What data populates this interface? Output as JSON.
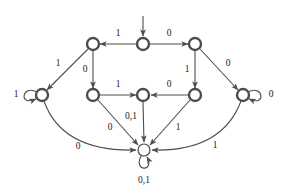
{
  "diagram": {
    "type": "state-transition-diagram",
    "stroke_color": "#4d4d4d",
    "node_fill": "#ffffff",
    "label_color": "#1a1a1a",
    "alphabet": [
      "0",
      "1"
    ]
  },
  "nodes": [
    {
      "id": "q_start",
      "name": "start-state",
      "cx": 143,
      "cy": 44,
      "r": 6.0,
      "style": "bold",
      "initial": true
    },
    {
      "id": "q_topleft",
      "name": "top-left-state",
      "cx": 93,
      "cy": 44,
      "r": 6.0,
      "style": "bold",
      "initial": false
    },
    {
      "id": "q_topright",
      "name": "top-right-state",
      "cx": 195,
      "cy": 44,
      "r": 6.0,
      "style": "bold",
      "initial": false
    },
    {
      "id": "q_farleft",
      "name": "far-left-state",
      "cx": 42,
      "cy": 95,
      "r": 6.0,
      "style": "bold",
      "initial": false
    },
    {
      "id": "q_midleft",
      "name": "mid-left-state",
      "cx": 93,
      "cy": 95,
      "r": 6.0,
      "style": "bold",
      "initial": false
    },
    {
      "id": "q_center",
      "name": "center-state",
      "cx": 143,
      "cy": 95,
      "r": 6.0,
      "style": "bold",
      "initial": false
    },
    {
      "id": "q_midright",
      "name": "mid-right-state",
      "cx": 195,
      "cy": 95,
      "r": 6.0,
      "style": "bold",
      "initial": false
    },
    {
      "id": "q_farright",
      "name": "far-right-state",
      "cx": 243,
      "cy": 95,
      "r": 6.0,
      "style": "bold",
      "initial": false
    },
    {
      "id": "q_trap",
      "name": "trap-state",
      "cx": 144,
      "cy": 150,
      "r": 6.0,
      "style": "thin",
      "initial": false
    }
  ],
  "start_arrow": {
    "name": "start-arrow",
    "path": "M 143 16 L 143 36",
    "points_to": "q_start"
  },
  "edges": [
    {
      "id": "e1",
      "name": "edge-start-to-topleft",
      "from": "q_start",
      "to": "q_topleft",
      "label": "1",
      "path": "M 136 44 L 100 44",
      "lx": 118,
      "ly": 34
    },
    {
      "id": "e2",
      "name": "edge-start-to-topright",
      "from": "q_start",
      "to": "q_topright",
      "label": "0",
      "path": "M 150 44 L 188 44",
      "lx": 169,
      "ly": 34
    },
    {
      "id": "e3",
      "name": "edge-topleft-to-farleft",
      "from": "q_topleft",
      "to": "q_farleft",
      "label": "1",
      "path": "M 88 49 L 47 90",
      "lx": 58,
      "ly": 64
    },
    {
      "id": "e4",
      "name": "edge-topleft-to-midleft",
      "from": "q_topleft",
      "to": "q_midleft",
      "label": "0",
      "path": "M 93 51 L 93 88",
      "lx": 85,
      "ly": 70
    },
    {
      "id": "e5",
      "name": "edge-topright-to-midright",
      "from": "q_topright",
      "to": "q_midright",
      "label": "1",
      "path": "M 195 51 L 195 88",
      "lx": 187,
      "ly": 70
    },
    {
      "id": "e6",
      "name": "edge-topright-to-farright",
      "from": "q_topright",
      "to": "q_farright",
      "label": "0",
      "path": "M 200 49 L 238 90",
      "lx": 228,
      "ly": 64
    },
    {
      "id": "e7",
      "name": "edge-midleft-to-center",
      "from": "q_midleft",
      "to": "q_center",
      "label": "1",
      "path": "M 100 95 L 136 95",
      "lx": 118,
      "ly": 85
    },
    {
      "id": "e8",
      "name": "edge-midright-to-center",
      "from": "q_midright",
      "to": "q_center",
      "label": "0",
      "path": "M 188 95 L 151 95",
      "lx": 169,
      "ly": 85
    },
    {
      "id": "e9",
      "name": "edge-center-to-trap",
      "from": "q_center",
      "to": "q_trap",
      "label": "0,1",
      "path": "M 143 102 L 144 142",
      "lx": 131,
      "ly": 117
    },
    {
      "id": "e10",
      "name": "edge-midleft-to-trap",
      "from": "q_midleft",
      "to": "q_trap",
      "label": "0",
      "path": "M 98 100 L 138 145",
      "lx": 110,
      "ly": 128
    },
    {
      "id": "e11",
      "name": "edge-midright-to-trap",
      "from": "q_midright",
      "to": "q_trap",
      "label": "1",
      "path": "M 190 100 L 150 145",
      "lx": 178,
      "ly": 128
    },
    {
      "id": "e12",
      "name": "edge-farleft-to-trap",
      "from": "q_farleft",
      "to": "q_trap",
      "label": "0",
      "path": "M 44 101 Q 62 152 136 150",
      "lx": 78,
      "ly": 147
    },
    {
      "id": "e13",
      "name": "edge-farright-to-trap",
      "from": "q_farright",
      "to": "q_trap",
      "label": "1",
      "path": "M 241 101 Q 222 152 152 150",
      "lx": 215,
      "ly": 146
    }
  ],
  "self_loops": [
    {
      "id": "l1",
      "name": "self-loop-far-left",
      "node": "q_farleft",
      "label": "1",
      "path": "M 37 92 C 22 84 18 107 36 99",
      "lx": 16,
      "ly": 95
    },
    {
      "id": "l2",
      "name": "self-loop-far-right",
      "node": "q_farright",
      "label": "0",
      "path": "M 248 92 C 263 84 267 107 249 99",
      "lx": 271,
      "ly": 95
    },
    {
      "id": "l3",
      "name": "self-loop-trap",
      "node": "q_trap",
      "label": "0,1",
      "path": "M 141 156 C 133 172 155 172 147 157",
      "lx": 144,
      "ly": 181
    }
  ]
}
